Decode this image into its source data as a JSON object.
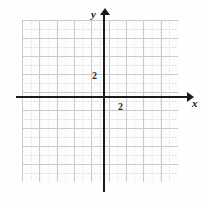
{
  "figure": {
    "type": "coordinate-grid",
    "title": "",
    "background_color": "#fefefe",
    "grid_color": "#d8d8d8",
    "major_grid_color": "#cbcbcb",
    "axis_color": "#1b1b1b"
  },
  "axes": {
    "x": {
      "label": "x",
      "arrow": "right",
      "tick_labels": [
        "2"
      ]
    },
    "y": {
      "label": "y",
      "arrow": "up",
      "tick_labels": [
        "2"
      ]
    }
  },
  "chart_data": {
    "type": "scatter",
    "title": "",
    "xlabel": "x",
    "ylabel": "y",
    "x": [],
    "y": [],
    "series": [],
    "xlim": [
      -9,
      8
    ],
    "ylim": [
      -9,
      8
    ],
    "xticks": [
      2
    ],
    "yticks": [
      2
    ],
    "xticklabels": [
      "2"
    ],
    "yticklabels": [
      "2"
    ],
    "grid": true,
    "grid_style": "dotted",
    "legend": "none",
    "annotations": []
  }
}
